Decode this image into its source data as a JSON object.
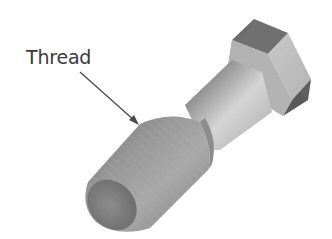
{
  "figure": {
    "callouts": [
      {
        "label": "Thread",
        "target": "threaded-section"
      }
    ]
  },
  "colors": {
    "background": "#ffffff",
    "label_text": "#3a3a3a",
    "arrow": "#4a4a4a",
    "hex_top_face": "#6e6e6e",
    "hex_side_face_light": "#c4c4c4",
    "hex_side_face_dark": "#5c5c5c",
    "shank_light": "#d4d4d4",
    "shank_dark": "#5e5e5e",
    "thread_body": "#8a8a8a",
    "thread_end": "#777777"
  }
}
